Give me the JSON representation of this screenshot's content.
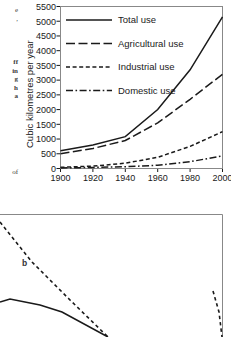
{
  "margin_text": {
    "fragments_top": [
      "e",
      ","
    ],
    "fragments_mid": [
      "ff",
      "in",
      "g",
      "h",
      "a"
    ],
    "fragments_bottom": [
      "of"
    ]
  },
  "figure_a": {
    "name": "global-water-use-chart",
    "axis": {
      "ylabel": "Cubic kilometres per year",
      "yticks": [
        0,
        500,
        1000,
        1500,
        2000,
        2500,
        3000,
        3500,
        4000,
        4500,
        5000,
        5500
      ],
      "xticks": [
        1900,
        1920,
        1940,
        1960,
        1980,
        2000
      ],
      "ylim": [
        0,
        5500
      ],
      "xlim": [
        1900,
        2000
      ]
    },
    "legend": [
      {
        "label": "Total use",
        "style": "solid"
      },
      {
        "label": "Agricultural use",
        "style": "dashed-long"
      },
      {
        "label": "Industrial use",
        "style": "dashed-short"
      },
      {
        "label": "Domestic use",
        "style": "dash-dot"
      }
    ]
  },
  "figure_b": {
    "name": "lower-partial-chart",
    "panel_label": "b"
  },
  "chart_data": [
    {
      "type": "line",
      "title": "",
      "xlabel": "",
      "ylabel": "Cubic kilometres per year",
      "xlim": [
        1900,
        2000
      ],
      "ylim": [
        0,
        5500
      ],
      "grid": false,
      "legend_position": "top-left",
      "x": [
        1900,
        1920,
        1940,
        1960,
        1980,
        2000
      ],
      "series": [
        {
          "name": "Total use",
          "style": "solid",
          "values": [
            600,
            800,
            1080,
            2000,
            3350,
            5150
          ]
        },
        {
          "name": "Agricultural use",
          "style": "dashed-long",
          "values": [
            500,
            680,
            950,
            1550,
            2350,
            3200
          ]
        },
        {
          "name": "Industrial use",
          "style": "dashed-short",
          "values": [
            40,
            80,
            180,
            380,
            750,
            1250
          ]
        },
        {
          "name": "Domestic use",
          "style": "dash-dot",
          "values": [
            20,
            35,
            60,
            110,
            230,
            430
          ]
        }
      ]
    },
    {
      "type": "line",
      "title": "",
      "xlabel": "",
      "ylabel": "",
      "grid": false,
      "annotations": [
        "b"
      ],
      "series": [
        {
          "name": "dashed-descending",
          "style": "dashed",
          "points": [
            [
              0,
              222
            ],
            [
              32,
              262
            ],
            [
              70,
              300
            ],
            [
              108,
              337
            ]
          ]
        },
        {
          "name": "solid-peak",
          "style": "solid",
          "points": [
            [
              0,
              302
            ],
            [
              10,
              299
            ],
            [
              40,
              305
            ],
            [
              62,
              312
            ],
            [
              108,
              337
            ]
          ]
        },
        {
          "name": "dashed-right-rise",
          "style": "dashed",
          "points": [
            [
              213,
              291
            ],
            [
              219,
              312
            ],
            [
              222,
              337
            ]
          ]
        }
      ]
    }
  ]
}
